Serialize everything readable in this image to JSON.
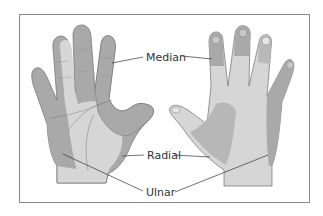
{
  "diagram": {
    "views": [
      "palmar (left hand)",
      "dorsal (right hand)"
    ],
    "labels": {
      "median": "Median",
      "radial": "Radial",
      "ulnar": "Ulnar"
    },
    "colors": {
      "skin_light": "#d6d6d6",
      "nerve_dark": "#a9a9a9",
      "outline": "#6e6e6e",
      "frame": "#8a8a8a",
      "leader_line": "#333333"
    }
  }
}
